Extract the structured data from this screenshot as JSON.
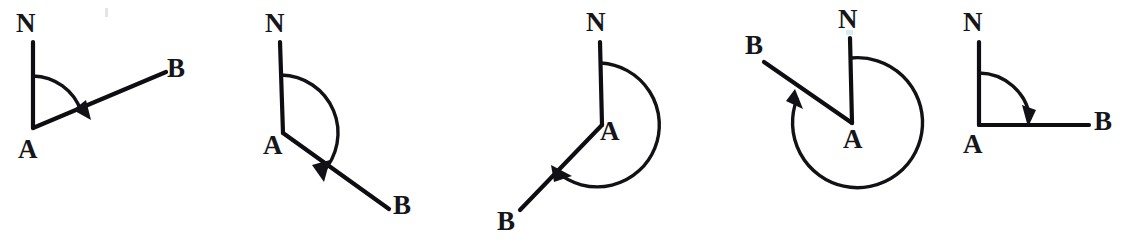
{
  "page": {
    "background_color": "#ffffff",
    "ink_color": "#15151a",
    "width": 1125,
    "height": 251
  },
  "figures": [
    {
      "id": "figure-1",
      "name": "acute-bearing-diagram",
      "vertex_label": "A",
      "north_label": "N",
      "ray_label": "B",
      "bearing_degrees": 73,
      "arc_direction": "clockwise",
      "arc_radius": 52,
      "vertex": {
        "x": 33,
        "y": 128
      },
      "north_point": {
        "x": 33,
        "y": 42
      },
      "ray_point": {
        "x": 166,
        "y": 72
      },
      "labels": {
        "north": {
          "x": 16,
          "y": 10
        },
        "vertex": {
          "x": 18,
          "y": 136
        },
        "ray": {
          "x": 167,
          "y": 55
        }
      }
    },
    {
      "id": "figure-2",
      "name": "obtuse-bearing-diagram",
      "vertex_label": "A",
      "north_label": "N",
      "ray_label": "B",
      "bearing_degrees": 137,
      "arc_direction": "clockwise",
      "arc_radius": 58,
      "vertex": {
        "x": 283,
        "y": 133
      },
      "north_point": {
        "x": 280,
        "y": 42
      },
      "ray_point": {
        "x": 389,
        "y": 209
      },
      "labels": {
        "north": {
          "x": 265,
          "y": 10
        },
        "vertex": {
          "x": 263,
          "y": 132
        },
        "ray": {
          "x": 393,
          "y": 192
        }
      }
    },
    {
      "id": "figure-3",
      "name": "reflex-bearing-diagram",
      "vertex_label": "A",
      "north_label": "N",
      "ray_label": "B",
      "bearing_degrees": 230,
      "arc_direction": "clockwise",
      "arc_radius": 62,
      "vertex": {
        "x": 602,
        "y": 125
      },
      "north_point": {
        "x": 600,
        "y": 42
      },
      "ray_point": {
        "x": 520,
        "y": 210
      },
      "labels": {
        "north": {
          "x": 586,
          "y": 9
        },
        "vertex": {
          "x": 600,
          "y": 118
        },
        "ray": {
          "x": 497,
          "y": 208
        }
      }
    },
    {
      "id": "figure-4",
      "name": "large-reflex-bearing-diagram",
      "vertex_label": "A",
      "north_label": "N",
      "ray_label": "B",
      "bearing_degrees": 302,
      "arc_direction": "clockwise",
      "arc_radius": 65,
      "vertex": {
        "x": 852,
        "y": 123
      },
      "north_point": {
        "x": 850,
        "y": 38
      },
      "ray_point": {
        "x": 764,
        "y": 62
      },
      "labels": {
        "north": {
          "x": 838,
          "y": 6
        },
        "vertex": {
          "x": 843,
          "y": 126
        },
        "ray": {
          "x": 745,
          "y": 32
        }
      }
    },
    {
      "id": "figure-5",
      "name": "right-angle-bearing-diagram",
      "vertex_label": "A",
      "north_label": "N",
      "ray_label": "B",
      "bearing_degrees": 90,
      "arc_direction": "clockwise",
      "arc_radius": 52,
      "vertex": {
        "x": 979,
        "y": 125
      },
      "north_point": {
        "x": 979,
        "y": 42
      },
      "ray_point": {
        "x": 1089,
        "y": 125
      },
      "labels": {
        "north": {
          "x": 963,
          "y": 9
        },
        "vertex": {
          "x": 963,
          "y": 131
        },
        "ray": {
          "x": 1094,
          "y": 108
        }
      }
    }
  ]
}
